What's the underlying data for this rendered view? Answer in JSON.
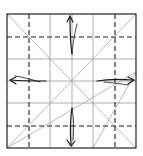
{
  "diagram": {
    "type": "origami-crease-pattern",
    "colors": {
      "background": "#ffffff",
      "border": "#222222",
      "grid": "#9a9a9a",
      "valley": "#222222",
      "diagonal": "#a8a8a8",
      "arrow": "#1a1a1a"
    },
    "square": {
      "x": 7,
      "y": 14,
      "width": 129,
      "height": 134
    },
    "grid_lines_x": [
      50,
      72,
      93
    ],
    "grid_lines_y": [
      59,
      81,
      103
    ],
    "valley_lines_x": [
      29,
      115
    ],
    "valley_lines_y": [
      37,
      126
    ],
    "diagonals": [
      {
        "x1": 7,
        "y1": 14,
        "x2": 136,
        "y2": 148
      },
      {
        "x1": 136,
        "y1": 14,
        "x2": 7,
        "y2": 148
      },
      {
        "x1": 7,
        "y1": 148,
        "x2": 136,
        "y2": 72
      },
      {
        "x1": 136,
        "y1": 72,
        "x2": 93,
        "y2": 148
      }
    ],
    "arrows": [
      {
        "name": "arrow-up",
        "direction": "up"
      },
      {
        "name": "arrow-down",
        "direction": "down"
      },
      {
        "name": "arrow-left",
        "direction": "left"
      },
      {
        "name": "arrow-right",
        "direction": "right"
      }
    ]
  }
}
